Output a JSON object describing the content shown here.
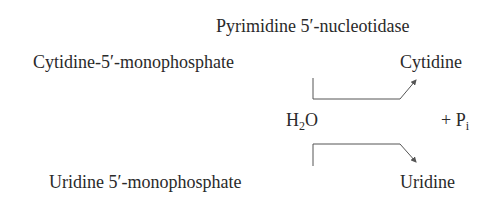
{
  "enzyme": "Pyrimidine 5′-nucleotidase",
  "reactions": [
    {
      "substrate": "Cytidine-5′-monophosphate",
      "product": "Cytidine"
    },
    {
      "substrate": "Uridine 5′-monophosphate",
      "product": "Uridine"
    }
  ],
  "cosubstrate": {
    "base": "H",
    "sub": "2",
    "rest": "O"
  },
  "coproduct": {
    "prefix": "+ P",
    "sub": "i"
  },
  "colors": {
    "text": "#2a2a2a",
    "arrow": "#555555"
  }
}
